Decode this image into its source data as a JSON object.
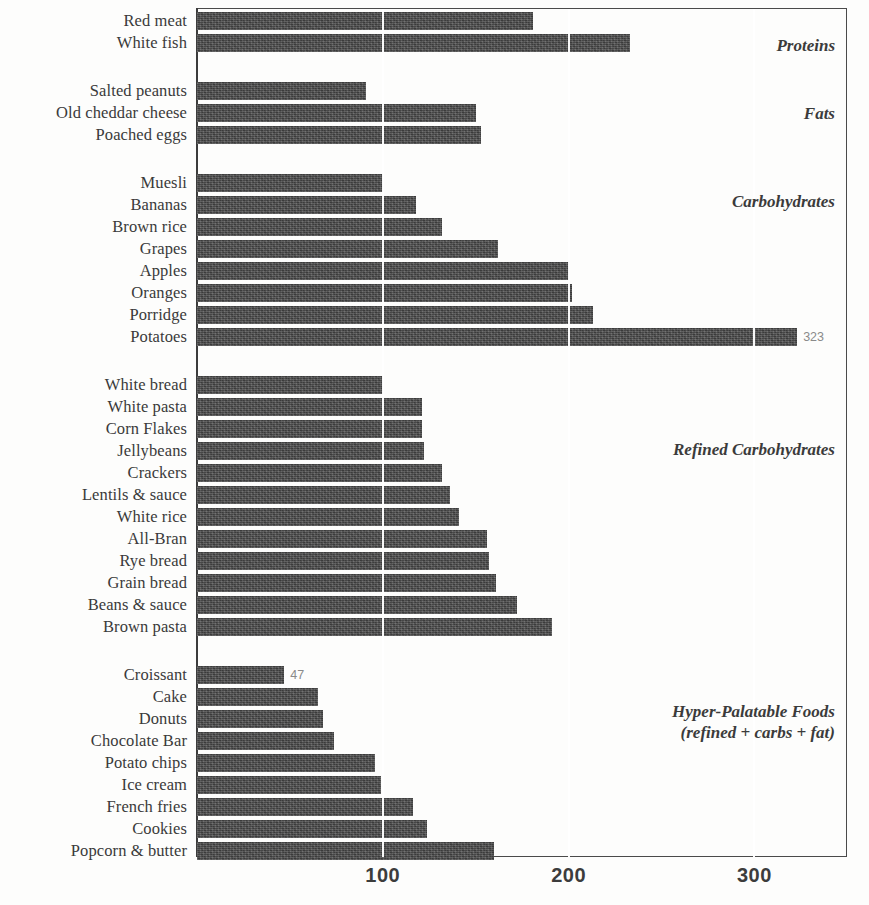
{
  "chart_data": {
    "type": "bar",
    "orientation": "horizontal",
    "title": "",
    "xlabel": "",
    "ylabel": "",
    "xlim": [
      0,
      350
    ],
    "xticks": [
      100,
      200,
      300
    ],
    "xtick_labels": [
      "100",
      "200",
      "300"
    ],
    "grid": true,
    "gridlines_at": [
      100,
      200,
      300
    ],
    "legend": "none",
    "bar_color": "#4b4b4b",
    "groups": [
      {
        "name": "Proteins",
        "annotation": "Proteins",
        "categories": [
          "Red meat",
          "White fish"
        ],
        "values": [
          181,
          233
        ]
      },
      {
        "name": "Fats",
        "annotation": "Fats",
        "categories": [
          "Salted peanuts",
          "Old cheddar cheese",
          "Poached eggs"
        ],
        "values": [
          91,
          150,
          153
        ]
      },
      {
        "name": "Carbohydrates",
        "annotation": "Carbohydrates",
        "categories": [
          "Muesli",
          "Bananas",
          "Brown rice",
          "Grapes",
          "Apples",
          "Oranges",
          "Porridge",
          "Potatoes"
        ],
        "values": [
          100,
          118,
          132,
          162,
          200,
          202,
          213,
          323
        ]
      },
      {
        "name": "Refined Carbohydrates",
        "annotation": "Refined Carbohydrates",
        "categories": [
          "White bread",
          "White pasta",
          "Corn Flakes",
          "Jellybeans",
          "Crackers",
          "Lentils & sauce",
          "White rice",
          "All-Bran",
          "Rye bread",
          "Grain bread",
          "Beans & sauce",
          "Brown pasta"
        ],
        "values": [
          100,
          121,
          121,
          122,
          132,
          136,
          141,
          156,
          157,
          161,
          172,
          191
        ]
      },
      {
        "name": "Hyper-Palatable Foods",
        "annotation": "Hyper-Palatable Foods\n(refined + carbs + fat)",
        "categories": [
          "Croissant",
          "Cake",
          "Donuts",
          "Chocolate Bar",
          "Potato chips",
          "Ice cream",
          "French fries",
          "Cookies",
          "Popcorn & butter"
        ],
        "values": [
          47,
          65,
          68,
          74,
          96,
          99,
          116,
          124,
          160
        ]
      }
    ],
    "data_labels": [
      {
        "category": "Potatoes",
        "value": 323,
        "text": "323"
      },
      {
        "category": "Croissant",
        "value": 47,
        "text": "47"
      }
    ]
  },
  "axis": {
    "ticks": [
      {
        "label": "100",
        "value": 100
      },
      {
        "label": "200",
        "value": 200
      },
      {
        "label": "300",
        "value": 300
      }
    ]
  },
  "sections": {
    "proteins": {
      "label": "Proteins"
    },
    "fats": {
      "label": "Fats"
    },
    "carbohydrates": {
      "label": "Carbohydrates"
    },
    "refined_carbohydrates": {
      "label": "Refined Carbohydrates"
    },
    "hyper_palatable": {
      "label": "Hyper-Palatable Foods\n(refined + carbs + fat)"
    }
  },
  "rows": [
    {
      "label": "Red meat",
      "value": 181,
      "data_label": ""
    },
    {
      "label": "White fish",
      "value": 233,
      "data_label": ""
    },
    {
      "label": "Salted peanuts",
      "value": 91,
      "data_label": ""
    },
    {
      "label": "Old cheddar cheese",
      "value": 150,
      "data_label": ""
    },
    {
      "label": "Poached eggs",
      "value": 153,
      "data_label": ""
    },
    {
      "label": "Muesli",
      "value": 100,
      "data_label": ""
    },
    {
      "label": "Bananas",
      "value": 118,
      "data_label": ""
    },
    {
      "label": "Brown rice",
      "value": 132,
      "data_label": ""
    },
    {
      "label": "Grapes",
      "value": 162,
      "data_label": ""
    },
    {
      "label": "Apples",
      "value": 200,
      "data_label": ""
    },
    {
      "label": "Oranges",
      "value": 202,
      "data_label": ""
    },
    {
      "label": "Porridge",
      "value": 213,
      "data_label": ""
    },
    {
      "label": "Potatoes",
      "value": 323,
      "data_label": "323"
    },
    {
      "label": "White bread",
      "value": 100,
      "data_label": ""
    },
    {
      "label": "White pasta",
      "value": 121,
      "data_label": ""
    },
    {
      "label": "Corn Flakes",
      "value": 121,
      "data_label": ""
    },
    {
      "label": "Jellybeans",
      "value": 122,
      "data_label": ""
    },
    {
      "label": "Crackers",
      "value": 132,
      "data_label": ""
    },
    {
      "label": "Lentils & sauce",
      "value": 136,
      "data_label": ""
    },
    {
      "label": "White rice",
      "value": 141,
      "data_label": ""
    },
    {
      "label": "All-Bran",
      "value": 156,
      "data_label": ""
    },
    {
      "label": "Rye bread",
      "value": 157,
      "data_label": ""
    },
    {
      "label": "Grain bread",
      "value": 161,
      "data_label": ""
    },
    {
      "label": "Beans & sauce",
      "value": 172,
      "data_label": ""
    },
    {
      "label": "Brown pasta",
      "value": 191,
      "data_label": ""
    },
    {
      "label": "Croissant",
      "value": 47,
      "data_label": "47"
    },
    {
      "label": "Cake",
      "value": 65,
      "data_label": ""
    },
    {
      "label": "Donuts",
      "value": 68,
      "data_label": ""
    },
    {
      "label": "Chocolate Bar",
      "value": 74,
      "data_label": ""
    },
    {
      "label": "Potato chips",
      "value": 96,
      "data_label": ""
    },
    {
      "label": "Ice cream",
      "value": 99,
      "data_label": ""
    },
    {
      "label": "French fries",
      "value": 116,
      "data_label": ""
    },
    {
      "label": "Cookies",
      "value": 124,
      "data_label": ""
    },
    {
      "label": "Popcorn & butter",
      "value": 160,
      "data_label": ""
    }
  ],
  "layout": {
    "row_tops": [
      12,
      34,
      82,
      104,
      126,
      174,
      196,
      218,
      240,
      262,
      284,
      306,
      328,
      376,
      398,
      420,
      442,
      464,
      486,
      508,
      530,
      552,
      574,
      596,
      618,
      666,
      688,
      710,
      732,
      754,
      776,
      798,
      820,
      842
    ],
    "section_tops": [
      36,
      104,
      192,
      440,
      702
    ]
  }
}
